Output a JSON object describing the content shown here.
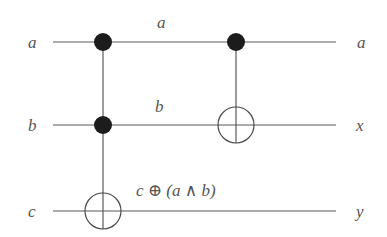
{
  "diagram": {
    "type": "quantum-circuit",
    "wires": [
      {
        "input": "a",
        "output": "a",
        "mid_label": "a"
      },
      {
        "input": "b",
        "output": "x",
        "mid_label": "b"
      },
      {
        "input": "c",
        "output": "y",
        "mid_label": "c ⊕ (a ∧ b)"
      }
    ],
    "gates": [
      {
        "type": "toffoli",
        "controls": [
          "a",
          "b"
        ],
        "target": "c"
      },
      {
        "type": "cnot",
        "controls": [
          "a"
        ],
        "target": "b"
      }
    ]
  }
}
